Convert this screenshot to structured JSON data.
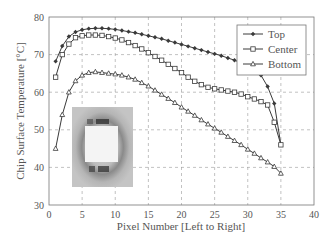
{
  "chart_data": {
    "type": "line",
    "title": "",
    "xlabel": "Pixel Number [Left to Right]",
    "ylabel": "Chip Surface Temperature [°C]",
    "xlim": [
      0,
      40
    ],
    "ylim": [
      30,
      80
    ],
    "xticks": [
      0,
      5,
      10,
      15,
      20,
      25,
      30,
      35,
      40
    ],
    "yticks": [
      30,
      40,
      50,
      60,
      70,
      80
    ],
    "grid": "dashed",
    "legend_position": "upper right",
    "x": [
      1,
      2,
      3,
      4,
      5,
      6,
      7,
      8,
      9,
      10,
      11,
      12,
      13,
      14,
      15,
      16,
      17,
      18,
      19,
      20,
      21,
      22,
      23,
      24,
      25,
      26,
      27,
      28,
      29,
      30,
      31,
      32,
      33,
      34,
      35
    ],
    "series": [
      {
        "name": "Top",
        "marker": "diamond",
        "values": [
          68.2,
          72.3,
          74.8,
          76.0,
          76.6,
          76.9,
          77.0,
          77.0,
          76.9,
          76.7,
          76.4,
          76.1,
          75.8,
          75.4,
          75.0,
          74.6,
          74.2,
          73.7,
          73.2,
          72.7,
          72.2,
          71.7,
          71.2,
          70.7,
          70.2,
          69.7,
          69.1,
          68.5,
          67.8,
          67.0,
          66.0,
          64.5,
          61.5,
          57.0,
          46.0
        ]
      },
      {
        "name": "Center",
        "marker": "square",
        "values": [
          64.0,
          70.0,
          72.8,
          74.5,
          75.0,
          75.2,
          75.2,
          75.1,
          74.8,
          74.4,
          73.9,
          73.2,
          72.4,
          71.5,
          70.5,
          69.5,
          68.5,
          67.4,
          66.3,
          65.2,
          64.0,
          62.9,
          62.0,
          61.3,
          60.9,
          60.6,
          60.3,
          60.0,
          59.5,
          58.8,
          58.2,
          57.5,
          56.6,
          52.0,
          46.0
        ]
      },
      {
        "name": "Bottom",
        "marker": "triangle",
        "values": [
          45.0,
          54.0,
          60.0,
          63.0,
          64.5,
          65.2,
          65.4,
          65.2,
          65.0,
          64.8,
          64.5,
          64.0,
          63.4,
          62.5,
          61.6,
          60.5,
          59.4,
          58.3,
          57.2,
          56.0,
          54.9,
          53.8,
          52.6,
          51.5,
          50.4,
          49.3,
          48.2,
          47.1,
          46.0,
          44.8,
          43.7,
          42.5,
          41.4,
          40.2,
          38.4
        ]
      }
    ],
    "inset": "thermal image of chip"
  },
  "axes": {
    "xlabel": "Pixel Number [Left to Right]",
    "ylabel": "Chip Surface Temperature [°C]",
    "xtick_labels": [
      "0",
      "5",
      "10",
      "15",
      "20",
      "25",
      "30",
      "35",
      "40"
    ],
    "ytick_labels": [
      "30",
      "40",
      "50",
      "60",
      "70",
      "80"
    ]
  },
  "legend": {
    "items": [
      {
        "label": "Top"
      },
      {
        "label": "Center"
      },
      {
        "label": "Bottom"
      }
    ]
  },
  "colors": {
    "line": "#3a3a3a",
    "grid": "#999999",
    "text": "#555555"
  }
}
